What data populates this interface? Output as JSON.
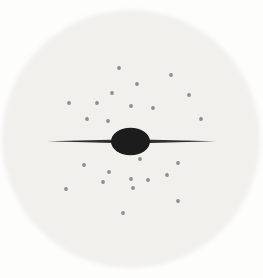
{
  "figure": {
    "canvas": {
      "width": 263,
      "height": 278
    },
    "background_color": "#fdfdfc",
    "halo": {
      "name": "spherical-halo",
      "cx": 131,
      "cy": 139,
      "r": 129,
      "color": "#f1f0ed",
      "edge_blur": 2.2
    },
    "galaxy": {
      "ellipse": {
        "name": "central-bulge",
        "cx": 130.5,
        "cy": 141.5,
        "rx": 19.5,
        "ry": 13.8,
        "color": "#1b1b1b",
        "edge_blur": 0.7
      },
      "spike": {
        "name": "galactic-disk-spike",
        "x_left_tip": 47.5,
        "x_right_tip": 215.5,
        "y_center": 141.3,
        "half_thickness_at_center": 2.1,
        "color": "#2d2d2d",
        "edge_blur": 0.45
      }
    },
    "clusters": {
      "name": "globular-cluster-dots",
      "color": "#8d8d8d",
      "radius": 1.9,
      "edge_blur": 0.45,
      "points": [
        [
          119,
          68
        ],
        [
          171,
          75
        ],
        [
          137,
          84
        ],
        [
          112,
          93
        ],
        [
          189,
          95
        ],
        [
          69,
          103
        ],
        [
          97,
          103
        ],
        [
          131,
          106
        ],
        [
          153,
          108
        ],
        [
          87,
          119
        ],
        [
          201,
          119
        ],
        [
          108,
          121
        ],
        [
          140,
          159
        ],
        [
          178,
          163
        ],
        [
          84,
          165
        ],
        [
          109,
          172
        ],
        [
          167,
          175
        ],
        [
          131,
          179
        ],
        [
          148,
          180
        ],
        [
          103,
          182
        ],
        [
          133,
          188
        ],
        [
          66,
          189
        ],
        [
          178,
          201
        ],
        [
          123,
          213
        ]
      ]
    }
  }
}
